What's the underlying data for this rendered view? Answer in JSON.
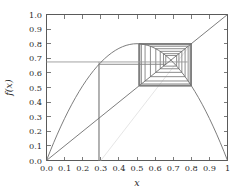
{
  "figure": {
    "kind": "cobweb-plot",
    "background_color": "#ffffff",
    "axes_color": "#5a5a5a",
    "text_color": "#2b2b2b"
  },
  "axes": {
    "xlabel": "x",
    "ylabel": "f(x)",
    "xlim": [
      0.0,
      1.0
    ],
    "ylim": [
      0.0,
      1.0
    ],
    "xticks": [
      0.0,
      0.1,
      0.2,
      0.3,
      0.4,
      0.5,
      0.6,
      0.7,
      0.8,
      0.9,
      1.0
    ],
    "xticklabels": [
      "0.0",
      "0.1",
      "0.2",
      "0.3",
      "0.4",
      "0.5",
      "0.6",
      "0.7",
      "0.8",
      "0.9",
      "1"
    ],
    "yticks": [
      0.0,
      0.1,
      0.2,
      0.3,
      0.4,
      0.5,
      0.6,
      0.7,
      0.8,
      0.9,
      1.0
    ],
    "yticklabels": [
      "0.0",
      "0.1",
      "0.2",
      "0.3",
      "0.4",
      "0.5",
      "0.6",
      "0.7",
      "0.8",
      "0.9",
      "1.0"
    ],
    "grid": false,
    "frame": "box"
  },
  "chart_data": {
    "type": "line",
    "title": "",
    "xlabel": "x",
    "ylabel": "f(x)",
    "xlim": [
      0.0,
      1.0
    ],
    "ylim": [
      0.0,
      1.0
    ],
    "grid": false,
    "legend": "none",
    "series": [
      {
        "name": "logistic-map-curve",
        "role": "map function f(x) = r x (1 - x), r = 3.2",
        "color": "#6e6e6e",
        "linewidth": 0.9,
        "x": [
          0.0,
          0.02,
          0.04,
          0.06,
          0.08,
          0.1,
          0.12,
          0.14,
          0.16,
          0.18,
          0.2,
          0.22,
          0.24,
          0.26,
          0.28,
          0.3,
          0.32,
          0.34,
          0.36,
          0.38,
          0.4,
          0.42,
          0.44,
          0.46,
          0.48,
          0.5,
          0.52,
          0.54,
          0.56,
          0.58,
          0.6,
          0.62,
          0.64,
          0.66,
          0.68,
          0.7,
          0.72,
          0.74,
          0.76,
          0.78,
          0.8,
          0.82,
          0.84,
          0.86,
          0.88,
          0.9,
          0.92,
          0.94,
          0.96,
          0.98,
          1.0
        ],
        "y": [
          0.0,
          0.0627,
          0.1229,
          0.1805,
          0.2355,
          0.288,
          0.3379,
          0.3853,
          0.4301,
          0.4723,
          0.512,
          0.5491,
          0.5837,
          0.6157,
          0.6451,
          0.672,
          0.6963,
          0.7181,
          0.7373,
          0.7539,
          0.768,
          0.7795,
          0.7885,
          0.7948,
          0.7987,
          0.8,
          0.7987,
          0.7948,
          0.7885,
          0.7795,
          0.768,
          0.7539,
          0.7373,
          0.7181,
          0.6963,
          0.672,
          0.6451,
          0.6157,
          0.5837,
          0.5491,
          0.512,
          0.4723,
          0.4301,
          0.3853,
          0.3379,
          0.288,
          0.2355,
          0.1805,
          0.1229,
          0.0627,
          0.0
        ]
      },
      {
        "name": "identity-line",
        "role": "y = x reference diagonal",
        "color": "#6e6e6e",
        "linewidth": 0.9,
        "x": [
          0.0,
          1.0
        ],
        "y": [
          0.0,
          1.0
        ]
      },
      {
        "name": "cobweb-orbit",
        "role": "staircase/cobweb iteration path from x0",
        "color": "#808080",
        "linewidth": 0.9,
        "x0": 0.29,
        "fixed_point": [
          0.6875,
          0.6875
        ],
        "spiral_extent_x": [
          0.503,
          0.78
        ],
        "spiral_extent_y": [
          0.512,
          0.8
        ],
        "iterates": [
          0.29,
          0.659,
          0.719,
          0.6463,
          0.7317,
          0.6284,
          0.7478,
          0.6038,
          0.7657,
          0.5742,
          0.7825,
          0.5446,
          0.7934,
          0.5241,
          0.7981,
          0.5156,
          0.7996,
          0.5128,
          0.7999,
          0.5122,
          0.8,
          0.512,
          0.8,
          0.512,
          0.8,
          0.512,
          0.8
        ]
      },
      {
        "name": "start-guide-line",
        "role": "faint guide from x0 on the axis into the spiral",
        "color": "#e2e2e2",
        "linewidth": 0.9,
        "x": [
          0.3,
          0.8
        ],
        "y": [
          0.0,
          0.8
        ]
      },
      {
        "name": "initial-value-marker",
        "role": "vertical drop at x0 and horizontal read-off at f(x0)",
        "color": "#9a9a9a",
        "linewidth": 0.9,
        "x0": 0.29,
        "fx0": 0.675
      }
    ],
    "annotations": []
  }
}
